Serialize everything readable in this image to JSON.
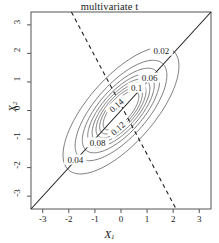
{
  "chart_data": {
    "type": "line",
    "subtype": "contour",
    "title": "multivariate t",
    "xlabel": "X1",
    "ylabel": "X2",
    "xlim": [
      -3.45,
      3.45
    ],
    "ylim": [
      -3.45,
      3.45
    ],
    "xticks": [
      -3,
      -2,
      -1,
      0,
      1,
      2,
      3
    ],
    "yticks": [
      -3,
      -2,
      -1,
      0,
      1,
      2,
      3
    ],
    "xtick_labels": [
      "-3",
      "-2",
      "-1",
      "0",
      "1",
      "2",
      "3"
    ],
    "ytick_labels": [
      "-3",
      "-2",
      "-1",
      "0",
      "1",
      "2",
      "3"
    ],
    "grid": false,
    "legend": "none",
    "distribution": {
      "name": "bivariate t",
      "center": [
        0,
        0
      ],
      "corr": 0.7,
      "sigma": [
        1,
        1
      ]
    },
    "contour_levels": [
      0.02,
      0.04,
      0.06,
      0.08,
      0.1,
      0.12,
      0.14,
      0.16
    ],
    "contour_labels": [
      {
        "level": "0.02",
        "x": 1.55,
        "y": 2.1,
        "rot": 0
      },
      {
        "level": "0.06",
        "x": 1.1,
        "y": 1.15,
        "rot": 0
      },
      {
        "level": "0.1",
        "x": 0.6,
        "y": 0.8,
        "rot": 0
      },
      {
        "level": "0.14",
        "x": -0.18,
        "y": 0.18,
        "rot": -42
      },
      {
        "level": "0.12",
        "x": -0.12,
        "y": -0.62,
        "rot": -42
      },
      {
        "level": "0.08",
        "x": -0.9,
        "y": -1.12,
        "rot": 0
      },
      {
        "level": "0.04",
        "x": -1.75,
        "y": -1.72,
        "rot": 0
      }
    ],
    "lines": [
      {
        "name": "major-axis",
        "style": "solid",
        "slope": 1,
        "intercept": 0
      },
      {
        "name": "minor-axis",
        "style": "dashed",
        "slope": -1.72,
        "intercept": 0.18
      }
    ],
    "axis_color": "#555555",
    "contour_color": "#5a5a5a",
    "line_color": "#202020"
  }
}
